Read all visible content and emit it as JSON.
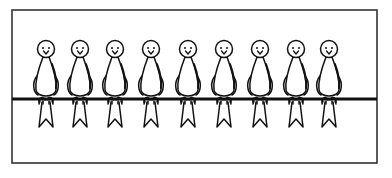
{
  "scene": {
    "title": "Birds on a wire",
    "frame": {
      "x": 12,
      "y": 10,
      "width": 365,
      "height": 153,
      "stroke": "#333333"
    },
    "wire": {
      "y": 99,
      "x1": 12,
      "x2": 377,
      "thickness": 3,
      "color": "#111111"
    },
    "bird_count": 9,
    "birds": [
      {
        "id": 1,
        "cx": 46
      },
      {
        "id": 2,
        "cx": 80
      },
      {
        "id": 3,
        "cx": 115
      },
      {
        "id": 4,
        "cx": 151
      },
      {
        "id": 5,
        "cx": 188
      },
      {
        "id": 6,
        "cx": 224
      },
      {
        "id": 7,
        "cx": 260
      },
      {
        "id": 8,
        "cx": 296
      },
      {
        "id": 9,
        "cx": 329
      }
    ],
    "ink_color": "#111111",
    "background": "#ffffff"
  }
}
